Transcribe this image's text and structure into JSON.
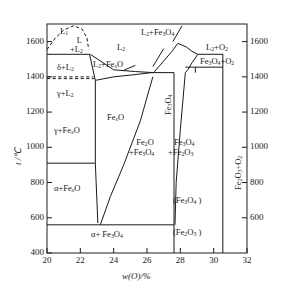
{
  "chart_data": {
    "type": "line",
    "xlabel": "w(O)/%",
    "ylabel": "t /°C",
    "xlim": [
      20,
      32
    ],
    "ylim": [
      400,
      1700
    ],
    "grid": false,
    "legend": "none",
    "x_ticks": [
      20,
      22,
      24,
      26,
      28,
      30,
      32
    ],
    "y_ticks_left": [
      1600,
      1400,
      1200,
      1000,
      800,
      600,
      400
    ],
    "y_ticks_right": [
      1600,
      1400,
      1200,
      1000,
      800,
      600
    ],
    "boundaries": [
      {
        "name": "miscibility-dome-L1-L2",
        "style": "dashed",
        "points": [
          [
            20.0,
            1555
          ],
          [
            20.5,
            1620
          ],
          [
            21.0,
            1665
          ],
          [
            21.6,
            1690
          ],
          [
            22.1,
            1672
          ],
          [
            22.4,
            1620
          ],
          [
            22.5,
            1555
          ]
        ]
      },
      {
        "name": "liquidus-flat-1528",
        "style": "solid",
        "points": [
          [
            20.0,
            1528
          ],
          [
            22.55,
            1528
          ]
        ]
      },
      {
        "name": "delta-L2-to-gamma-L2-vertical",
        "style": "solid",
        "points": [
          [
            22.55,
            1528
          ],
          [
            22.9,
            1380
          ]
        ]
      },
      {
        "name": "peritectic-1400-dashed-upper",
        "style": "dashed",
        "points": [
          [
            20.0,
            1400
          ],
          [
            22.78,
            1400
          ]
        ]
      },
      {
        "name": "peritectic-1390-dashed-lower",
        "style": "dashed",
        "points": [
          [
            20.0,
            1390
          ],
          [
            22.85,
            1390
          ]
        ]
      },
      {
        "name": "FexO-left-boundary-vertical",
        "style": "solid",
        "points": [
          [
            22.9,
            1380
          ],
          [
            22.9,
            910
          ],
          [
            23.05,
            570
          ]
        ]
      },
      {
        "name": "eutectoid-910-line",
        "style": "solid",
        "points": [
          [
            20.0,
            910
          ],
          [
            22.9,
            910
          ]
        ]
      },
      {
        "name": "eutectoid-560-line",
        "style": "solid",
        "points": [
          [
            20.0,
            560
          ],
          [
            27.62,
            560
          ]
        ]
      },
      {
        "name": "FexO-lower-right-curve",
        "style": "solid",
        "points": [
          [
            23.2,
            560
          ],
          [
            23.8,
            720
          ],
          [
            24.6,
            900
          ],
          [
            25.6,
            1150
          ],
          [
            26.35,
            1400
          ]
        ]
      },
      {
        "name": "FexO-liquidus-upper",
        "style": "solid",
        "points": [
          [
            22.9,
            1380
          ],
          [
            24.0,
            1400
          ],
          [
            25.2,
            1412
          ],
          [
            26.3,
            1424
          ]
        ]
      },
      {
        "name": "L2-FexO-upper-boundary",
        "style": "solid",
        "points": [
          [
            22.6,
            1528
          ],
          [
            24.0,
            1440
          ],
          [
            25.3,
            1430
          ],
          [
            26.4,
            1424
          ]
        ]
      },
      {
        "name": "flat-1424-line",
        "style": "solid",
        "points": [
          [
            26.3,
            1424
          ],
          [
            27.62,
            1424
          ]
        ]
      },
      {
        "name": "L2-Fe3O4-liquidus",
        "style": "solid",
        "points": [
          [
            26.4,
            1424
          ],
          [
            27.0,
            1490
          ],
          [
            27.5,
            1545
          ],
          [
            27.85,
            1590
          ]
        ]
      },
      {
        "name": "Fe3O4-peak-right-side",
        "style": "solid",
        "points": [
          [
            27.85,
            1590
          ],
          [
            28.35,
            1570
          ],
          [
            28.7,
            1545
          ],
          [
            29.05,
            1528
          ]
        ]
      },
      {
        "name": "Fe3O4-solidus-right",
        "style": "solid",
        "points": [
          [
            29.05,
            1528
          ],
          [
            28.7,
            1480
          ],
          [
            28.45,
            1440
          ],
          [
            28.3,
            1424
          ]
        ]
      },
      {
        "name": "upper-flat-1528-right",
        "style": "solid",
        "points": [
          [
            29.05,
            1528
          ],
          [
            30.55,
            1528
          ]
        ]
      },
      {
        "name": "flat-1455-right",
        "style": "solid",
        "points": [
          [
            28.3,
            1455
          ],
          [
            30.55,
            1455
          ]
        ]
      },
      {
        "name": "Fe3O4-stoich-vertical",
        "style": "solid",
        "points": [
          [
            27.62,
            1424
          ],
          [
            27.62,
            400
          ]
        ]
      },
      {
        "name": "Fe3O4-right-solvus",
        "style": "solid",
        "points": [
          [
            28.3,
            1424
          ],
          [
            28.0,
            1100
          ],
          [
            27.75,
            800
          ],
          [
            27.68,
            560
          ]
        ]
      },
      {
        "name": "Fe2O3-vertical-right",
        "style": "solid",
        "points": [
          [
            30.55,
            1528
          ],
          [
            30.55,
            400
          ]
        ]
      },
      {
        "name": "small-tie-28-30",
        "style": "solid",
        "points": [
          [
            28.9,
            1455
          ],
          [
            28.9,
            1424
          ]
        ]
      },
      {
        "name": "pointer-line-to-L2Fe3O4",
        "style": "solid",
        "points": [
          [
            27.55,
            1600
          ],
          [
            28.1,
            1690
          ]
        ]
      },
      {
        "name": "leader-L2-Fe3O4-label",
        "style": "solid",
        "points": [
          [
            26.35,
            1458
          ],
          [
            27.0,
            1560
          ]
        ]
      },
      {
        "name": "leader-L2-FexO-label",
        "style": "solid",
        "points": [
          [
            24.6,
            1437
          ],
          [
            25.3,
            1465
          ]
        ]
      }
    ],
    "region_labels": [
      {
        "text": "L1",
        "x": 20.9,
        "y": 1660
      },
      {
        "text": "L +L2",
        "x": 21.7,
        "y": 1585
      },
      {
        "text": "L2",
        "x": 24.3,
        "y": 1600
      },
      {
        "text": "L2+Fe3O4",
        "x": 26.6,
        "y": 1690
      },
      {
        "text": "L2+O2",
        "x": 29.8,
        "y": 1580
      },
      {
        "text": "Fe3O4+O2",
        "x": 29.6,
        "y": 1490
      },
      {
        "text": "d+L2",
        "x": 21.3,
        "y": 1460
      },
      {
        "text": "g+L2",
        "x": 21.3,
        "y": 1345
      },
      {
        "text": "L2+FexO",
        "x": 23.5,
        "y": 1468
      },
      {
        "text": "FexO",
        "x": 24.4,
        "y": 1240
      },
      {
        "text": "g+FexO",
        "x": 21.2,
        "y": 1100
      },
      {
        "text": "a+FexO",
        "x": 21.2,
        "y": 760
      },
      {
        "text": "a+ Fe3O4",
        "x": 24.0,
        "y": 490
      },
      {
        "text": "Fe2O+Fe3O4",
        "x": 26.5,
        "y": 1010
      },
      {
        "text": "Fe3O4+Fe2O3",
        "x": 28.7,
        "y": 1010
      },
      {
        "text": "(Fe3O4 )",
        "x": 28.7,
        "y": 660
      },
      {
        "text": "(Fe2O3 )",
        "x": 28.7,
        "y": 520
      },
      {
        "text": "Fe3O4",
        "x": 27.95,
        "y": 1290
      },
      {
        "text": "Fe2O3+O2",
        "x": 31.0,
        "y": 880
      }
    ]
  },
  "axes": {
    "y_label": "t /°C",
    "x_label": "w(O)/%",
    "x_ticks": [
      "20",
      "22",
      "24",
      "26",
      "28",
      "30",
      "32"
    ],
    "y_ticks": [
      "1600",
      "1400",
      "1200",
      "1000",
      "800",
      "600",
      "400"
    ],
    "y_ticks_right": [
      "1600",
      "1400",
      "1200",
      "1000",
      "800",
      "600"
    ]
  },
  "regions": {
    "l1": "L",
    "l1_sub": "1",
    "l_plus_l2_a": "L",
    "l_plus_l2_b": "+L",
    "l_plus_l2_sub": "2",
    "l2": "L",
    "l2_sub": "2",
    "l2_fe3o4": "L",
    "l2_o2": "L",
    "fe3o4_o2": "Fe",
    "delta_l2": "δ+L",
    "gamma_l2": "γ+L",
    "l2_fexo": "L",
    "fexo": "Fe",
    "gamma_fexo": "γ+Fe",
    "alpha_fexo": "α+Fe",
    "alpha_fe3o4": "α+ Fe",
    "fe2o_fe3o4_1": "Fe",
    "fe2o_fe3o4_2": "+Fe",
    "fe3o4_fe2o3_1": "Fe",
    "fe3o4_fe2o3_2": "+Fe",
    "paren_fe3o4": "(Fe",
    "paren_fe2o3": "(Fe",
    "fe3o4_vert": "Fe",
    "fe2o3_o2": "Fe"
  }
}
